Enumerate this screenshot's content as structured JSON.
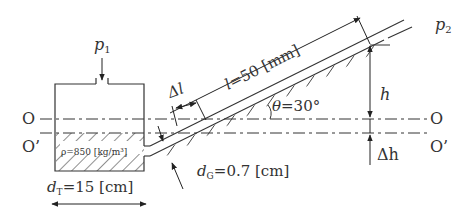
{
  "figure": {
    "type": "inclined-tube-manometer",
    "colors": {
      "line": "#333333",
      "background": "#ffffff"
    }
  },
  "labels": {
    "p1": "p",
    "p1_sub": "1",
    "p2": "p",
    "p2_sub": "2",
    "O_left": "O",
    "Oprime_left": "O’",
    "O_right": "O",
    "Oprime_right": "O’",
    "length_var": "l",
    "length_val": "=50 [mm]",
    "delta_l": "Δl",
    "angle_var": "θ",
    "angle_val": "=30°",
    "h": "h",
    "delta_h": "Δh",
    "density": "ρ=850 [kg/m³]",
    "dG_var": "d",
    "dG_sub": "G",
    "dG_val": "=0.7 [cm]",
    "dT_var": "d",
    "dT_sub": "T",
    "dT_val": "=15 [cm]"
  },
  "values": {
    "l_mm": 50,
    "theta_deg": 30,
    "rho_kg_m3": 850,
    "dG_cm": 0.7,
    "dT_cm": 15
  }
}
